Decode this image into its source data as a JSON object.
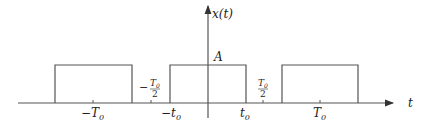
{
  "diagram": {
    "y_axis_label": "x(t)",
    "x_axis_label": "t",
    "amplitude_label": "A",
    "tick_labels": {
      "neg_T0": "−T",
      "neg_T0_sub": "0",
      "neg_half_T0_minus": "−",
      "half_T0_num": "T",
      "half_T0_num_sub": "0",
      "half_T0_den": "2",
      "neg_t0": "−t",
      "neg_t0_sub": "0",
      "t0": "t",
      "t0_sub": "0",
      "pos_half_T0_num": "T",
      "pos_half_T0_num_sub": "0",
      "pos_half_T0_den": "2",
      "T0": "T",
      "T0_sub": "0"
    },
    "pulses": [
      {
        "name": "pulse-left",
        "center": "-T0",
        "x1": 55,
        "x2": 132
      },
      {
        "name": "pulse-center",
        "center": "0",
        "x1": 170,
        "x2": 246
      },
      {
        "name": "pulse-right",
        "center": "T0",
        "x1": 282,
        "x2": 358
      }
    ],
    "colors": {
      "line": "#555555",
      "text": "#222222"
    }
  }
}
